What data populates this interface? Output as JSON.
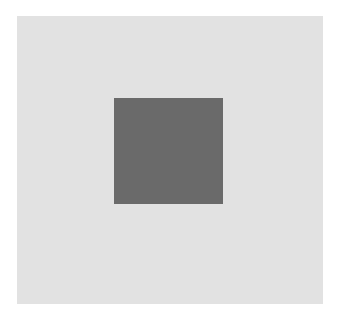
{
  "figure": {
    "outer_square": {
      "color": "#e2e2e2"
    },
    "inner_square": {
      "color": "#6a6a6a"
    },
    "background_color": "#ffffff"
  }
}
